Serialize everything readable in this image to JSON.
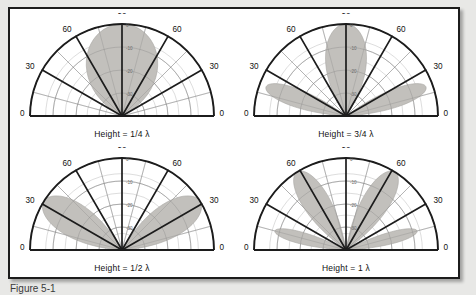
{
  "figure": {
    "caption": "Figure 5-1",
    "background": "#e8e8e6",
    "panel_background": "#ffffff",
    "border_color": "#1c1c1c",
    "lobe_fill": "#c2c0bc",
    "lobe_stroke": "#a8a6a2",
    "grid_color": "#8d8d8d",
    "axis_color": "#1c1c1c",
    "label_color": "#111111"
  },
  "chart_data": [
    {
      "type": "line",
      "title": "Height = 1/4 λ",
      "subtitle": "",
      "xlabel": "",
      "ylabel": "",
      "projection": "polar-half",
      "angle_unit": "degrees",
      "angle_range": [
        0,
        180
      ],
      "angle_ticks": [
        0,
        30,
        60,
        90,
        120,
        150,
        180
      ],
      "angle_tick_labels": [
        "0",
        "30",
        "60",
        "90",
        "60",
        "30",
        "0"
      ],
      "minor_spoke_step": 15,
      "radial_label": "dB",
      "radial_ticks": [
        0,
        -10,
        -20,
        -30
      ],
      "radial_tick_labels": [
        "0",
        "-10",
        "-20",
        "-30"
      ],
      "rlim": [
        -40,
        0
      ],
      "grid": true,
      "legend": "none",
      "lobes": [
        {
          "name": "main",
          "peak_angle_deg": 90,
          "peak_db": 0,
          "half_width_deg": 62
        }
      ],
      "series": [
        {
          "name": "elevation pattern",
          "angles_deg": [
            0,
            10,
            20,
            30,
            40,
            50,
            60,
            70,
            80,
            90,
            100,
            110,
            120,
            130,
            140,
            150,
            160,
            170,
            180
          ],
          "values_db": [
            -40,
            -22,
            -14,
            -9,
            -5.5,
            -3,
            -1.4,
            -0.5,
            -0.1,
            0,
            -0.1,
            -0.5,
            -1.4,
            -3,
            -5.5,
            -9,
            -14,
            -22,
            -40
          ]
        }
      ]
    },
    {
      "type": "line",
      "title": "Height = 3/4 λ",
      "subtitle": "",
      "xlabel": "",
      "ylabel": "",
      "projection": "polar-half",
      "angle_unit": "degrees",
      "angle_range": [
        0,
        180
      ],
      "angle_ticks": [
        0,
        30,
        60,
        90,
        120,
        150,
        180
      ],
      "angle_tick_labels": [
        "0",
        "30",
        "60",
        "90",
        "60",
        "30",
        "0"
      ],
      "minor_spoke_step": 15,
      "radial_label": "dB",
      "radial_ticks": [
        0,
        -10,
        -20,
        -30
      ],
      "radial_tick_labels": [
        "0",
        "-10",
        "-20",
        "-30"
      ],
      "rlim": [
        -40,
        0
      ],
      "grid": true,
      "legend": "none",
      "lobes": [
        {
          "name": "main",
          "peak_angle_deg": 90,
          "peak_db": 0,
          "half_width_deg": 34
        },
        {
          "name": "lower-right",
          "peak_angle_deg": 20,
          "peak_db": -3,
          "half_width_deg": 16
        },
        {
          "name": "lower-left",
          "peak_angle_deg": 160,
          "peak_db": -3,
          "half_width_deg": 16
        }
      ],
      "series": [
        {
          "name": "elevation pattern",
          "angles_deg": [
            0,
            10,
            20,
            30,
            40,
            50,
            60,
            70,
            80,
            90,
            100,
            110,
            120,
            130,
            140,
            150,
            160,
            170,
            180
          ],
          "values_db": [
            -40,
            -7,
            -3,
            -7,
            -16,
            -13,
            -6,
            -2,
            -0.4,
            0,
            -0.4,
            -2,
            -6,
            -13,
            -16,
            -7,
            -3,
            -7,
            -40
          ]
        }
      ]
    },
    {
      "type": "line",
      "title": "Height = 1/2 λ",
      "subtitle": "",
      "xlabel": "",
      "ylabel": "",
      "projection": "polar-half",
      "angle_unit": "degrees",
      "angle_range": [
        0,
        180
      ],
      "angle_ticks": [
        0,
        30,
        60,
        90,
        120,
        150,
        180
      ],
      "angle_tick_labels": [
        "0",
        "30",
        "60",
        "90",
        "60",
        "30",
        "0"
      ],
      "minor_spoke_step": 15,
      "radial_label": "dB",
      "radial_ticks": [
        0,
        -10,
        -20,
        -30
      ],
      "radial_tick_labels": [
        "0",
        "-10",
        "-20",
        "-30"
      ],
      "rlim": [
        -40,
        0
      ],
      "grid": true,
      "legend": "none",
      "lobes": [
        {
          "name": "right",
          "peak_angle_deg": 32,
          "peak_db": 0,
          "half_width_deg": 28
        },
        {
          "name": "left",
          "peak_angle_deg": 148,
          "peak_db": 0,
          "half_width_deg": 28
        }
      ],
      "series": [
        {
          "name": "elevation pattern",
          "angles_deg": [
            0,
            10,
            20,
            30,
            40,
            50,
            60,
            70,
            80,
            90,
            100,
            110,
            120,
            130,
            140,
            150,
            160,
            170,
            180
          ],
          "values_db": [
            -40,
            -6,
            -1.5,
            0,
            -1.5,
            -4,
            -8,
            -14,
            -24,
            -40,
            -24,
            -14,
            -8,
            -4,
            -1.5,
            0,
            -1.5,
            -6,
            -40
          ]
        }
      ]
    },
    {
      "type": "line",
      "title": "Height = 1 λ",
      "subtitle": "",
      "xlabel": "",
      "ylabel": "",
      "projection": "polar-half",
      "angle_unit": "degrees",
      "angle_range": [
        0,
        180
      ],
      "angle_ticks": [
        0,
        30,
        60,
        90,
        120,
        150,
        180
      ],
      "angle_tick_labels": [
        "0",
        "30",
        "60",
        "90",
        "60",
        "30",
        "0"
      ],
      "minor_spoke_step": 15,
      "radial_label": "dB",
      "radial_ticks": [
        0,
        -10,
        -20,
        -30
      ],
      "radial_tick_labels": [
        "0",
        "-10",
        "-20",
        "-30"
      ],
      "rlim": [
        -40,
        0
      ],
      "grid": true,
      "legend": "none",
      "lobes": [
        {
          "name": "upper-right",
          "peak_angle_deg": 58,
          "peak_db": 0,
          "half_width_deg": 22
        },
        {
          "name": "upper-left",
          "peak_angle_deg": 122,
          "peak_db": 0,
          "half_width_deg": 22
        },
        {
          "name": "lower-right",
          "peak_angle_deg": 15,
          "peak_db": -8,
          "half_width_deg": 12
        },
        {
          "name": "lower-left",
          "peak_angle_deg": 165,
          "peak_db": -8,
          "half_width_deg": 12
        }
      ],
      "series": [
        {
          "name": "elevation pattern",
          "angles_deg": [
            0,
            10,
            20,
            30,
            40,
            50,
            60,
            70,
            80,
            90,
            100,
            110,
            120,
            130,
            140,
            150,
            160,
            170,
            180
          ],
          "values_db": [
            -40,
            -9,
            -10,
            -20,
            -6,
            -1.5,
            0,
            -2,
            -9,
            -26,
            -9,
            -2,
            0,
            -1.5,
            -6,
            -20,
            -10,
            -9,
            -40
          ]
        }
      ]
    }
  ]
}
